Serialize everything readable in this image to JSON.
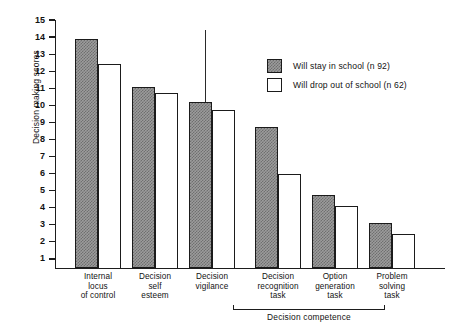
{
  "chart_data": {
    "type": "bar",
    "title": "",
    "xlabel": "",
    "ylabel": "Decision making scores",
    "ylim": [
      0,
      15
    ],
    "yticks": [
      15,
      14,
      13,
      12,
      11,
      10,
      9,
      8,
      7,
      6,
      5,
      4,
      3,
      2,
      1
    ],
    "grid": false,
    "legend_position": "top-right",
    "categories": [
      "Internal locus of control",
      "Decision self esteem",
      "Decision vigilance",
      "Decision recognition task",
      "Option generation task",
      "Problem solving task"
    ],
    "series": [
      {
        "name": "Will stay in school (n 92)",
        "values": [
          13.9,
          11.1,
          10.2,
          8.75,
          4.75,
          3.1
        ]
      },
      {
        "name": "Will drop out of school (n 62)",
        "values": [
          12.4,
          10.7,
          9.75,
          5.95,
          4.1,
          2.45
        ]
      }
    ],
    "annotations": [
      "Decision competence"
    ]
  },
  "axis": {
    "y_title": "Decision making scores",
    "y_tick_labels": [
      "15",
      "14",
      "13",
      "12",
      "11",
      "10",
      "9",
      "8",
      "7",
      "6",
      "5",
      "4",
      "3",
      "2",
      "1"
    ]
  },
  "categories": [
    {
      "lines": [
        "Internal",
        "locus",
        "of control"
      ]
    },
    {
      "lines": [
        "Decision",
        "self",
        "esteem"
      ]
    },
    {
      "lines": [
        "Decision",
        "vigilance"
      ]
    },
    {
      "lines": [
        "Decision",
        "recognition",
        "task"
      ]
    },
    {
      "lines": [
        "Option",
        "generation",
        "task"
      ]
    },
    {
      "lines": [
        "Problem",
        "solving",
        "task"
      ]
    }
  ],
  "group_bracket": {
    "label": "Decision competence"
  },
  "legend": {
    "items": [
      {
        "label": "Will stay in school (n 92)",
        "style": "filled"
      },
      {
        "label": "Will drop out of school (n 62)",
        "style": "open"
      }
    ]
  },
  "colors": {
    "ink": "#1b1b1b",
    "bar_fill": "#9c9c9c",
    "bar_hatch": "#6f6f6f",
    "bar_open": "#ffffff",
    "background": "#ffffff"
  }
}
